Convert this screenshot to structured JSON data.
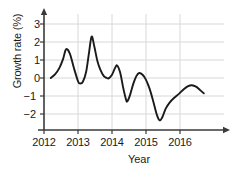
{
  "chart_data": {
    "type": "line",
    "title": "",
    "xlabel": "Year",
    "ylabel": "Growth rate (%)",
    "xlim": [
      2012,
      2016.95
    ],
    "ylim": [
      -2.65,
      3.45
    ],
    "xticks": [
      2012,
      2013,
      2014,
      2015,
      2016
    ],
    "xtick_labels": [
      "2012",
      "2013",
      "2014",
      "2015",
      "2016"
    ],
    "yticks": [
      3,
      2,
      1,
      0,
      -1,
      -2
    ],
    "ytick_labels": [
      "3",
      "2",
      "1",
      "0",
      "−1",
      "−2"
    ],
    "grid": true,
    "legend": false,
    "line_color": "#1a1a1a",
    "grid_color": "#d8d8d8",
    "axis_color": "#3a3a3a",
    "series": [
      {
        "name": "Growth rate",
        "x": [
          2012.2,
          2012.33,
          2012.45,
          2012.56,
          2012.65,
          2012.76,
          2012.88,
          2013.0,
          2013.05,
          2013.14,
          2013.24,
          2013.32,
          2013.4,
          2013.48,
          2013.57,
          2013.66,
          2013.76,
          2013.85,
          2013.9,
          2014.0,
          2014.08,
          2014.15,
          2014.24,
          2014.33,
          2014.41,
          2014.45,
          2014.53,
          2014.63,
          2014.72,
          2014.8,
          2014.9,
          2015.0,
          2015.11,
          2015.22,
          2015.32,
          2015.4,
          2015.48,
          2015.58,
          2015.7,
          2015.83,
          2015.97,
          2016.11,
          2016.24,
          2016.35,
          2016.47,
          2016.58,
          2016.7
        ],
        "y": [
          0.0,
          0.22,
          0.55,
          1.05,
          1.6,
          1.35,
          0.55,
          -0.18,
          -0.3,
          -0.22,
          0.35,
          1.35,
          2.3,
          1.75,
          0.95,
          0.45,
          0.1,
          0.0,
          -0.02,
          0.18,
          0.52,
          0.7,
          0.3,
          -0.55,
          -1.18,
          -1.3,
          -0.95,
          -0.3,
          0.12,
          0.28,
          0.18,
          -0.1,
          -0.62,
          -1.35,
          -2.05,
          -2.35,
          -2.18,
          -1.7,
          -1.35,
          -1.1,
          -0.88,
          -0.62,
          -0.45,
          -0.4,
          -0.48,
          -0.65,
          -0.85
        ]
      }
    ]
  },
  "caption": ""
}
